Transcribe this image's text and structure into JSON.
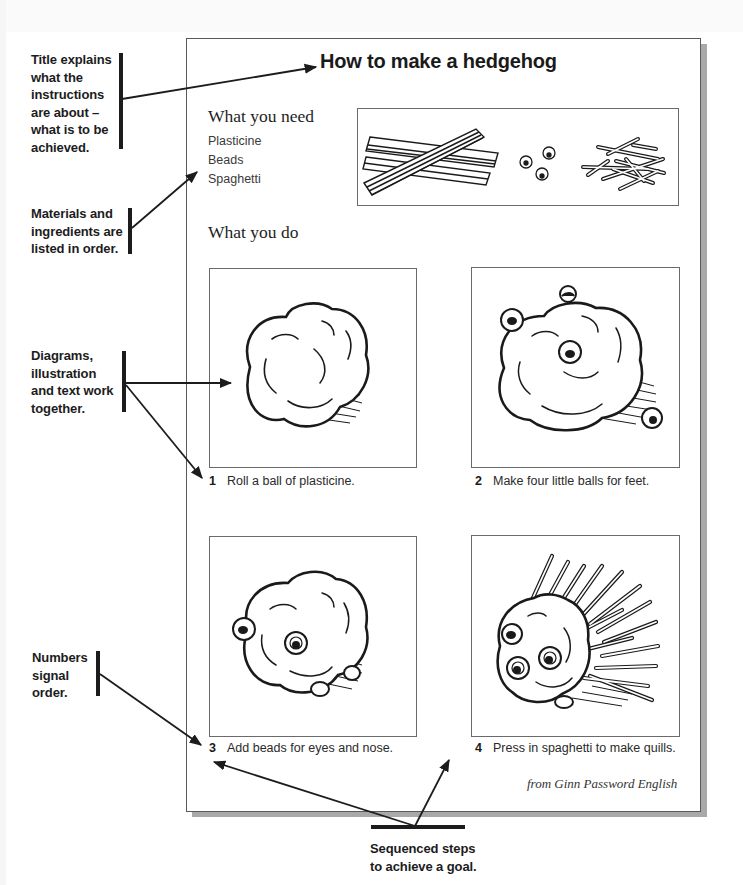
{
  "page": {
    "title": "How to make a hedgehog",
    "needs_heading": "What you need",
    "materials": [
      "Plasticine",
      "Beads",
      "Spaghetti"
    ],
    "do_heading": "What you do",
    "steps": [
      {
        "number": "1",
        "text": "Roll a ball of plasticine.",
        "illustration": "plasticine-ball"
      },
      {
        "number": "2",
        "text": "Make four little balls for feet.",
        "illustration": "ball-with-feet"
      },
      {
        "number": "3",
        "text": "Add beads for eyes and nose.",
        "illustration": "ball-with-eyes-and-nose"
      },
      {
        "number": "4",
        "text": "Press in spaghetti to make quills.",
        "illustration": "hedgehog-with-quills"
      }
    ],
    "source": "from Ginn Password English",
    "materials_illustration": [
      "plasticine-sticks",
      "beads",
      "spaghetti-pieces"
    ]
  },
  "annotations": {
    "title_note": [
      "Title explains",
      "what the",
      "instructions",
      "are about –",
      "what is to be",
      "achieved."
    ],
    "materials_note": [
      "Materials and",
      "ingredients are",
      "listed in order."
    ],
    "diagrams_note": [
      "Diagrams,",
      "illustration",
      "and text work",
      "together."
    ],
    "numbers_note": [
      "Numbers",
      "signal",
      "order."
    ],
    "sequence_note": [
      "Sequenced steps",
      "to achieve a goal."
    ]
  },
  "colors": {
    "ink": "#1c1c1c",
    "frame": "#5a5a5a",
    "shadow": "#a9a9a9",
    "caption": "#2a2a2a"
  }
}
